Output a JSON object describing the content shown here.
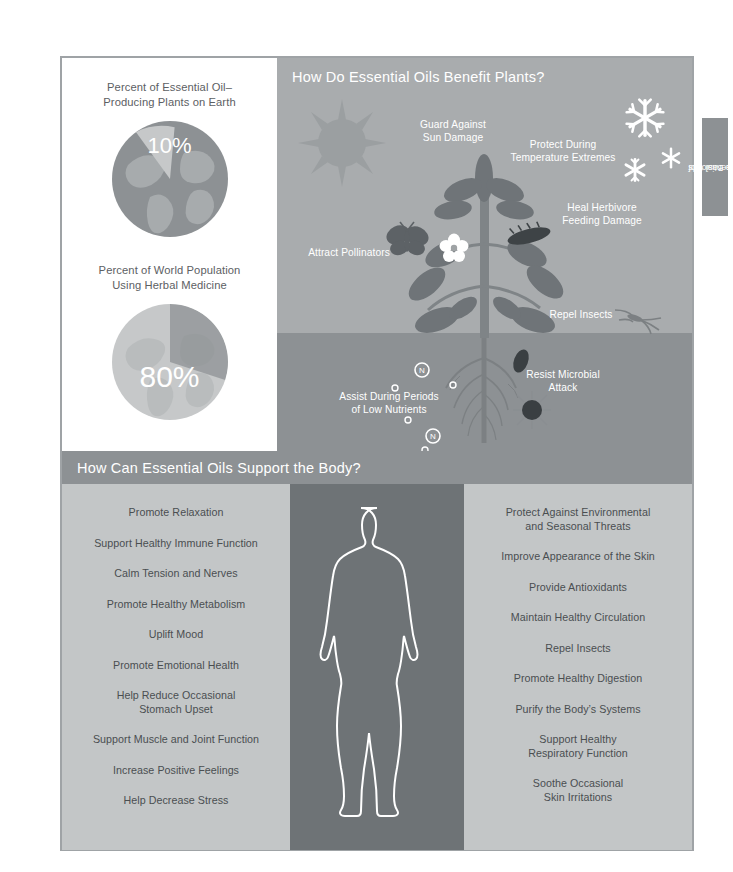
{
  "side_tab": {
    "line1": "The Basics of",
    "line2": "Essential Oils",
    "full": "The Basics of Essential Oils"
  },
  "stats": {
    "items": [
      {
        "title_line1": "Percent of Essential Oil–",
        "title_line2": "Producing Plants on Earth",
        "percent": "10%",
        "value": 10
      },
      {
        "title_line1": "Percent of World Population",
        "title_line2": "Using Herbal Medicine",
        "percent": "80%",
        "value": 80
      }
    ]
  },
  "plants": {
    "title": "How Do Essential Oils Benefit Plants?",
    "labels": {
      "sun": "Guard Against\nSun Damage",
      "sun_l1": "Guard Against",
      "sun_l2": "Sun Damage",
      "temp_l1": "Protect During",
      "temp_l2": "Temperature Extremes",
      "heal_l1": "Heal Herbivore",
      "heal_l2": "Feeding Damage",
      "pollinators": "Attract Pollinators",
      "repel": "Repel Insects",
      "nutrients_l1": "Assist During Periods",
      "nutrients_l2": "of Low Nutrients",
      "microbial_l1": "Resist Microbial",
      "microbial_l2": "Attack"
    },
    "soil_markers": [
      "N",
      "N",
      "N"
    ]
  },
  "body": {
    "title": "How Can Essential Oils Support the Body?",
    "left_column": [
      "Promote Relaxation",
      "Support Healthy Immune Function",
      "Calm Tension and Nerves",
      "Promote Healthy Metabolism",
      "Uplift Mood",
      "Promote Emotional Health",
      "Help Reduce Occasional\nStomach Upset",
      "Support Muscle and Joint Function",
      "Increase Positive Feelings",
      "Help Decrease Stress"
    ],
    "right_column": [
      "Protect Against Environmental\nand Seasonal Threats",
      "Improve Appearance of the Skin",
      "Provide Antioxidants",
      "Maintain Healthy Circulation",
      "Repel Insects",
      "Promote Healthy Digestion",
      "Purify the Body’s Systems",
      "Support Healthy\nRespiratory Function",
      "Soothe Occasional\nSkin Irritations"
    ]
  },
  "chart_data": [
    {
      "type": "pie",
      "title": "Percent of Essential Oil–Producing Plants on Earth",
      "categories": [
        "Essential Oil–Producing Plants",
        "Other Plants"
      ],
      "values": [
        10,
        90
      ],
      "labels": [
        "10%",
        ""
      ],
      "legend": "none",
      "colors": [
        "#c6c8c9",
        "#8d9194"
      ]
    },
    {
      "type": "pie",
      "title": "Percent of World Population Using Herbal Medicine",
      "categories": [
        "Using Herbal Medicine",
        "Not Using Herbal Medicine"
      ],
      "values": [
        80,
        20
      ],
      "labels": [
        "80%",
        ""
      ],
      "legend": "none",
      "colors": [
        "#c6c8c9",
        "#8d9194"
      ]
    }
  ],
  "colors": {
    "panel_grey": "#a9acae",
    "soil_grey": "#8d9194",
    "list_grey": "#c3c6c7",
    "figure_grey": "#6e7376",
    "text_dark": "#4a4e51",
    "white": "#ffffff"
  }
}
